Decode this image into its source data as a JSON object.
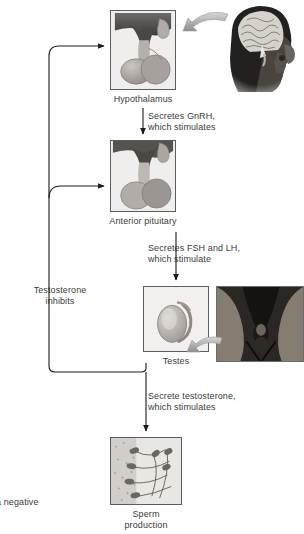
{
  "figure": {
    "type": "flow-diagram",
    "caption_visible_fragment": "a negative"
  },
  "nodes": [
    {
      "id": "hypothalamus",
      "label": "Hypothalamus",
      "icon": "hypothalamus-illustration"
    },
    {
      "id": "anterior_pituitary",
      "label": "Anterior pituitary",
      "icon": "pituitary-illustration"
    },
    {
      "id": "testes",
      "label": "Testes",
      "icon": "testis-illustration"
    },
    {
      "id": "sperm",
      "label_line1": "Sperm",
      "label_line2": "production",
      "icon": "sperm-micrograph"
    }
  ],
  "photos": [
    {
      "id": "head_photo",
      "icon": "head-brain-photo",
      "alt": "Head in profile showing brain"
    },
    {
      "id": "groin_photo",
      "icon": "pelvis-photo",
      "alt": "Pelvic region"
    }
  ],
  "arrow_labels": [
    {
      "id": "gnrh",
      "line1": "Secretes GnRH,",
      "line2": "which stimulates"
    },
    {
      "id": "fshlh",
      "line1": "Secretes FSH and LH,",
      "line2": "which stimulate"
    },
    {
      "id": "testo",
      "line1": "Secrete testosterone,",
      "line2": "which stimulates"
    }
  ],
  "feedback": {
    "line1": "Testosterone",
    "line2": "inhibits"
  },
  "colors": {
    "text": "#3b3b3b",
    "line": "#1a1a1a",
    "panel_border": "#5d5d5d",
    "panel_bg": "#efeeec",
    "photo_arrow": "#b9b9b9"
  }
}
